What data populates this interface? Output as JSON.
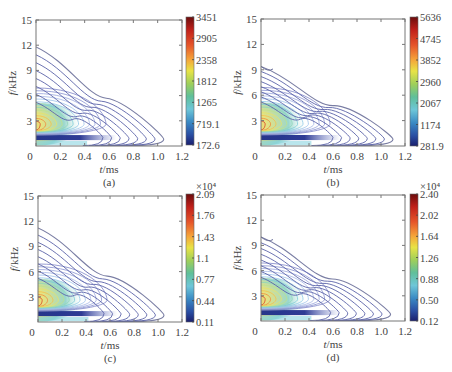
{
  "chart_data": [
    {
      "type": "contour",
      "panel_label": "(a)",
      "xlabel": "t/ms",
      "ylabel": "f/kHz",
      "xlim": [
        0,
        1.2
      ],
      "ylim": [
        0,
        15
      ],
      "xticks": [
        "0",
        "0.2",
        "0.4",
        "0.6",
        "0.8",
        "1.0",
        "1.2"
      ],
      "yticks": [
        "3",
        "6",
        "9",
        "12",
        "15"
      ],
      "colorbar": {
        "ticks": [
          "3451",
          "2905",
          "2358",
          "1812",
          "1265",
          "719.1",
          "172.6"
        ],
        "min": 172.6,
        "max": 3451,
        "multiplier": ""
      },
      "peak": {
        "t": 0.0,
        "f": 2.6
      },
      "outer_contour_extent": {
        "t_max": 1.05,
        "f_max_at_t0": 11.8
      },
      "grid": false
    },
    {
      "type": "contour",
      "panel_label": "(b)",
      "xlabel": "t/ms",
      "ylabel": "f/kHz",
      "xlim": [
        0,
        1.2
      ],
      "ylim": [
        0,
        15
      ],
      "xticks": [
        "0",
        "0.2",
        "0.4",
        "0.6",
        "0.8",
        "1.0",
        "1.2"
      ],
      "yticks": [
        "3",
        "6",
        "9",
        "12",
        "15"
      ],
      "colorbar": {
        "ticks": [
          "5636",
          "4745",
          "3852",
          "2960",
          "2067",
          "1174",
          "281.9"
        ],
        "min": 281.9,
        "max": 5636,
        "multiplier": ""
      },
      "peak": {
        "t": 0.0,
        "f": 2.6
      },
      "outer_contour_extent": {
        "t_max": 1.1,
        "f_max_at_t0": 9.4
      },
      "grid": false
    },
    {
      "type": "contour",
      "panel_label": "(c)",
      "xlabel": "t/ms",
      "ylabel": "f/kHz",
      "xlim": [
        0,
        1.2
      ],
      "ylim": [
        0,
        15
      ],
      "xticks": [
        "0",
        "0.2",
        "0.4",
        "0.6",
        "0.8",
        "1.0",
        "1.2"
      ],
      "yticks": [
        "3",
        "6",
        "9",
        "12",
        "15"
      ],
      "colorbar": {
        "ticks": [
          "2.09",
          "1.76",
          "1.43",
          "1.1",
          "0.77",
          "0.44",
          "0.11"
        ],
        "min": 0.11,
        "max": 2.09,
        "multiplier": "×10⁴"
      },
      "peak": {
        "t": 0.0,
        "f": 2.6
      },
      "outer_contour_extent": {
        "t_max": 1.05,
        "f_max_at_t0": 11.2
      },
      "grid": false
    },
    {
      "type": "contour",
      "panel_label": "(d)",
      "xlabel": "t/ms",
      "ylabel": "f/kHz",
      "xlim": [
        0,
        1.2
      ],
      "ylim": [
        0,
        15
      ],
      "xticks": [
        "0",
        "0.2",
        "0.4",
        "0.6",
        "0.8",
        "1.0",
        "1.2"
      ],
      "yticks": [
        "3",
        "6",
        "9",
        "12",
        "15"
      ],
      "colorbar": {
        "ticks": [
          "2.40",
          "2.02",
          "1.64",
          "1.26",
          "0.88",
          "0.50",
          "0.12"
        ],
        "min": 0.12,
        "max": 2.4,
        "multiplier": "×10⁴"
      },
      "peak": {
        "t": 0.0,
        "f": 2.6
      },
      "outer_contour_extent": {
        "t_max": 1.08,
        "f_max_at_t0": 10.0
      },
      "grid": false
    }
  ],
  "panels": [
    {
      "label": "(a)",
      "xlabel_t": "t",
      "xlabel_unit": "/ms",
      "ylabel_f": "f",
      "ylabel_unit": "/kHz"
    },
    {
      "label": "(b)",
      "xlabel_t": "t",
      "xlabel_unit": "/ms",
      "ylabel_f": "f",
      "ylabel_unit": "/kHz"
    },
    {
      "label": "(c)",
      "xlabel_t": "t",
      "xlabel_unit": "/ms",
      "ylabel_f": "f",
      "ylabel_unit": "/kHz",
      "cb_multiplier": "×10⁴"
    },
    {
      "label": "(d)",
      "xlabel_t": "t",
      "xlabel_unit": "/ms",
      "ylabel_f": "f",
      "ylabel_unit": "/kHz",
      "cb_multiplier": "×10⁴"
    }
  ],
  "colormap": [
    "#7f0000",
    "#d7191c",
    "#f46d43",
    "#fdae61",
    "#fee08b",
    "#d9ef8b",
    "#66c2a5",
    "#72c5d9",
    "#3288bd",
    "#2c4fa0",
    "#1a237e"
  ]
}
